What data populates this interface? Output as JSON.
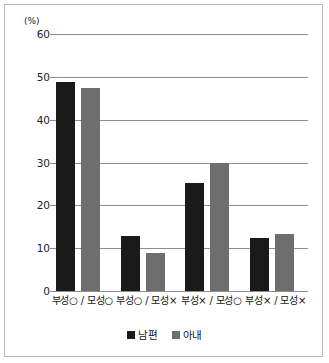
{
  "chart_data": {
    "type": "bar",
    "title": "",
    "subtitle": "",
    "xlabel": "",
    "ylabel": "",
    "unit_label": "(%)",
    "ylim": [
      0,
      60
    ],
    "ytick_labels": [
      "60",
      "50",
      "40",
      "30",
      "20",
      "10",
      "0"
    ],
    "yticks": [
      60,
      50,
      40,
      30,
      20,
      10,
      0
    ],
    "grid": "horizontal",
    "legend_position": "bottom-center",
    "categories": [
      "부성○ / 모성○",
      "부성○ / 모성×",
      "부성× / 모성○",
      "부성× / 모성×"
    ],
    "series": [
      {
        "name": "남편",
        "color": "#1a1a1a",
        "values": [
          48.7,
          12.9,
          25.2,
          12.4
        ]
      },
      {
        "name": "아내",
        "color": "#6e6e6e",
        "values": [
          47.4,
          8.9,
          29.8,
          13.2
        ]
      }
    ]
  },
  "colors": {
    "husband": "#1a1a1a",
    "wife": "#6e6e6e",
    "gridline": "#8e8e8e",
    "frame_border": "#b9b9b9",
    "text": "#141414",
    "background": "#ffffff"
  }
}
